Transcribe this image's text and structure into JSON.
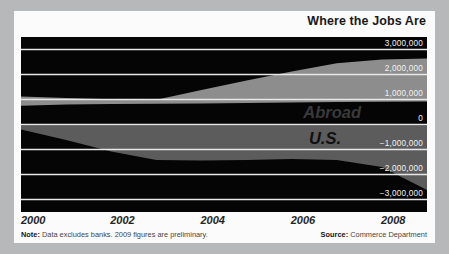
{
  "chart_data": {
    "type": "area",
    "title": "Where the Jobs Are",
    "xlabel": "",
    "ylabel": "",
    "ylim": [
      -3500000,
      3500000
    ],
    "xlim": [
      2000,
      2009
    ],
    "grid": true,
    "legend_position": "inline-annotations",
    "ytick_labels": [
      "3,000,000",
      "2,000,000",
      "1,000,000",
      "0",
      "−1,000,000",
      "−2,000,000",
      "−3,000,000"
    ],
    "ytick_values": [
      3000000,
      2000000,
      1000000,
      0,
      -1000000,
      -2000000,
      -3000000
    ],
    "xtick_labels": [
      "2000",
      "2002",
      "2004",
      "2006",
      "2008"
    ],
    "xtick_values": [
      2000,
      2002,
      2004,
      2006,
      2008
    ],
    "x": [
      2000,
      2001,
      2002,
      2003,
      2004,
      2005,
      2006,
      2007,
      2008,
      2009
    ],
    "series": [
      {
        "name": "Abroad",
        "color": "#8d8d8d",
        "lower": [
          750000,
          800000,
          820000,
          830000,
          840000,
          860000,
          880000,
          900000,
          910000,
          920000
        ],
        "upper": [
          1120000,
          1060000,
          1010000,
          990000,
          1380000,
          1760000,
          2120000,
          2450000,
          2600000,
          2640000
        ]
      },
      {
        "name": "U.S.",
        "color": "#5c5c5c",
        "lower": [
          -200000,
          -620000,
          -1080000,
          -1420000,
          -1440000,
          -1420000,
          -1380000,
          -1420000,
          -1700000,
          -2620000
        ],
        "upper": [
          -30000,
          -30000,
          -30000,
          -30000,
          -30000,
          -30000,
          -30000,
          -30000,
          -30000,
          -30000
        ]
      }
    ],
    "annotations": [
      {
        "text": "Abroad",
        "series": "Abroad"
      },
      {
        "text": "U.S.",
        "series": "U.S."
      }
    ],
    "note": "Data excludes banks. 2009 figures are preliminary.",
    "note_prefix": "Note:",
    "source": "Commerce Department",
    "source_prefix": "Source:",
    "background": "#050505",
    "gridline_color": "#e8e8e8",
    "card_background": "#fbfbfb",
    "page_background": "#b7b8ba"
  },
  "header": {
    "title": "Where the Jobs Are"
  },
  "axis": {
    "y_labels": [
      "3,000,000",
      "2,000,000",
      "1,000,000",
      "0",
      "−1,000,000",
      "−2,000,000",
      "−3,000,000"
    ],
    "x_labels": [
      "2000",
      "2002",
      "2004",
      "2006",
      "2008"
    ]
  },
  "bands": {
    "abroad_label": "Abroad",
    "us_label": "U.S."
  },
  "footer": {
    "note_prefix": "Note:",
    "note_text": " Data excludes banks. 2009 figures are preliminary.",
    "source_prefix": "Source:",
    "source_text": " Commerce Department"
  }
}
